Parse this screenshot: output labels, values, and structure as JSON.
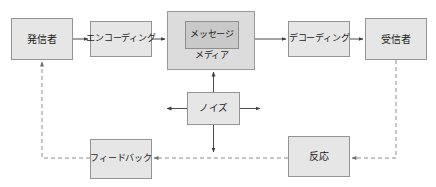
{
  "diagram": {
    "colors": {
      "node_fill": "#e6e6e6",
      "node_border": "#949494",
      "media_fill": "#dcdcdc",
      "message_fill": "#c9c9c9",
      "solid_line": "#4a4a4a",
      "dashed_line": "#8c8c8c",
      "background": "#ffffff",
      "text": "#1c1c1c"
    },
    "nodes": {
      "sender": {
        "label": "発信者",
        "x": 11,
        "y": 18,
        "w": 62,
        "h": 42
      },
      "encoding": {
        "label": "エンコーディング",
        "x": 90,
        "y": 21,
        "w": 62,
        "h": 36
      },
      "media": {
        "label": "メディア",
        "x": 167,
        "y": 11,
        "w": 88,
        "h": 59
      },
      "message": {
        "label": "メッセージ",
        "x": 184,
        "y": 20,
        "w": 54,
        "h": 28
      },
      "decoding": {
        "label": "デコーディング",
        "x": 288,
        "y": 21,
        "w": 62,
        "h": 36
      },
      "receiver": {
        "label": "受信者",
        "x": 365,
        "y": 18,
        "w": 62,
        "h": 42
      },
      "noise": {
        "label": "ノイズ",
        "x": 187,
        "y": 92,
        "w": 53,
        "h": 33
      },
      "feedback": {
        "label": "フィードバック",
        "x": 90,
        "y": 139,
        "w": 62,
        "h": 40
      },
      "reaction": {
        "label": "反応",
        "x": 288,
        "y": 136,
        "w": 62,
        "h": 41
      }
    },
    "edges": [
      {
        "name": "sender-to-encoding",
        "from": "sender",
        "to": "encoding",
        "style": "solid",
        "direction": "right"
      },
      {
        "name": "encoding-to-media",
        "from": "encoding",
        "to": "media",
        "style": "solid",
        "direction": "right"
      },
      {
        "name": "media-to-decoding",
        "from": "media",
        "to": "decoding",
        "style": "solid",
        "direction": "right"
      },
      {
        "name": "decoding-to-receiver",
        "from": "decoding",
        "to": "receiver",
        "style": "solid",
        "direction": "right"
      },
      {
        "name": "noise-to-media",
        "from": "noise",
        "to": "media",
        "style": "solid",
        "direction": "up"
      },
      {
        "name": "noise-to-left",
        "from": "noise",
        "to": "left",
        "style": "solid",
        "direction": "left"
      },
      {
        "name": "noise-to-right",
        "from": "noise",
        "to": "right",
        "style": "solid",
        "direction": "right"
      },
      {
        "name": "noise-to-feedback-line",
        "from": "noise",
        "to": "feedback-line",
        "style": "solid",
        "direction": "down"
      },
      {
        "name": "receiver-to-reaction",
        "from": "receiver",
        "to": "reaction",
        "style": "dashed",
        "direction": "left"
      },
      {
        "name": "reaction-to-feedback",
        "from": "reaction",
        "to": "feedback",
        "style": "dashed",
        "direction": "left"
      },
      {
        "name": "feedback-to-sender",
        "from": "feedback",
        "to": "sender",
        "style": "dashed",
        "direction": "up"
      }
    ]
  }
}
